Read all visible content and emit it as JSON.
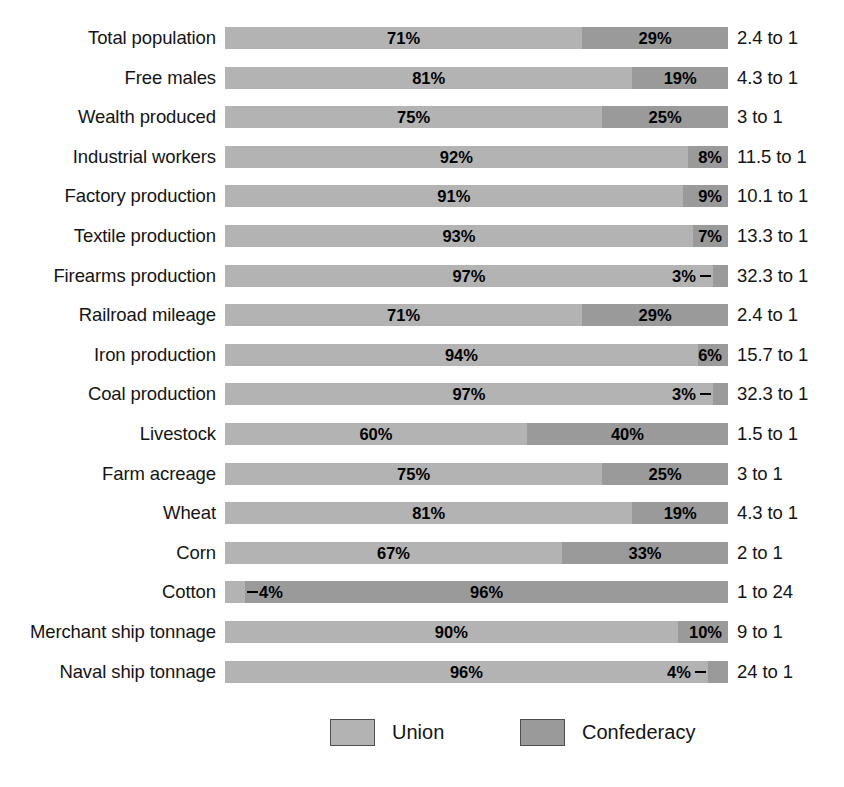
{
  "chart_data": {
    "type": "bar",
    "subtype": "stacked-horizontal-100-percent",
    "title": "",
    "xlabel": "",
    "ylabel": "",
    "xlim": [
      0,
      100
    ],
    "grid": false,
    "legend_position": "bottom",
    "categories": [
      "Total population",
      "Free males",
      "Wealth produced",
      "Industrial workers",
      "Factory production",
      "Textile production",
      "Firearms production",
      "Railroad mileage",
      "Iron production",
      "Coal production",
      "Livestock",
      "Farm acreage",
      "Wheat",
      "Corn",
      "Cotton",
      "Merchant ship tonnage",
      "Naval ship tonnage"
    ],
    "series": [
      {
        "name": "Union",
        "color": "#b3b3b3",
        "values": [
          71,
          81,
          75,
          92,
          91,
          93,
          97,
          71,
          94,
          97,
          60,
          75,
          81,
          67,
          4,
          90,
          96
        ]
      },
      {
        "name": "Confederacy",
        "color": "#9a9a9a",
        "values": [
          29,
          19,
          25,
          8,
          9,
          7,
          3,
          29,
          6,
          3,
          40,
          25,
          19,
          33,
          96,
          10,
          4
        ]
      }
    ],
    "ratios": [
      "2.4 to 1",
      "4.3 to 1",
      "3 to 1",
      "11.5 to 1",
      "10.1 to 1",
      "13.3 to 1",
      "32.3 to 1",
      "2.4 to 1",
      "15.7 to 1",
      "32.3 to 1",
      "1.5 to 1",
      "3 to 1",
      "4.3 to 1",
      "2 to 1",
      "1 to 24",
      "9 to 1",
      "24 to 1"
    ]
  },
  "rows": [
    {
      "label": "Total population",
      "union_pct": 71,
      "conf_pct": 29,
      "union_text": "71%",
      "conf_text": "29%",
      "ratio": "2.4 to 1",
      "leader": "none"
    },
    {
      "label": "Free males",
      "union_pct": 81,
      "conf_pct": 19,
      "union_text": "81%",
      "conf_text": "19%",
      "ratio": "4.3 to 1",
      "leader": "none"
    },
    {
      "label": "Wealth produced",
      "union_pct": 75,
      "conf_pct": 25,
      "union_text": "75%",
      "conf_text": "25%",
      "ratio": "3 to 1",
      "leader": "none"
    },
    {
      "label": "Industrial workers",
      "union_pct": 92,
      "conf_pct": 8,
      "union_text": "92%",
      "conf_text": "8%",
      "ratio": "11.5 to 1",
      "leader": "none"
    },
    {
      "label": "Factory production",
      "union_pct": 91,
      "conf_pct": 9,
      "union_text": "91%",
      "conf_text": "9%",
      "ratio": "10.1 to 1",
      "leader": "none"
    },
    {
      "label": "Textile production",
      "union_pct": 93,
      "conf_pct": 7,
      "union_text": "93%",
      "conf_text": "7%",
      "ratio": "13.3 to 1",
      "leader": "none"
    },
    {
      "label": "Firearms production",
      "union_pct": 97,
      "conf_pct": 3,
      "union_text": "97%",
      "conf_text": "3%",
      "ratio": "32.3 to 1",
      "leader": "right"
    },
    {
      "label": "Railroad mileage",
      "union_pct": 71,
      "conf_pct": 29,
      "union_text": "71%",
      "conf_text": "29%",
      "ratio": "2.4 to 1",
      "leader": "none"
    },
    {
      "label": "Iron production",
      "union_pct": 94,
      "conf_pct": 6,
      "union_text": "94%",
      "conf_text": "6%",
      "ratio": "15.7 to 1",
      "leader": "none"
    },
    {
      "label": "Coal production",
      "union_pct": 97,
      "conf_pct": 3,
      "union_text": "97%",
      "conf_text": "3%",
      "ratio": "32.3 to 1",
      "leader": "right"
    },
    {
      "label": "Livestock",
      "union_pct": 60,
      "conf_pct": 40,
      "union_text": "60%",
      "conf_text": "40%",
      "ratio": "1.5 to 1",
      "leader": "none"
    },
    {
      "label": "Farm acreage",
      "union_pct": 75,
      "conf_pct": 25,
      "union_text": "75%",
      "conf_text": "25%",
      "ratio": "3 to 1",
      "leader": "none"
    },
    {
      "label": "Wheat",
      "union_pct": 81,
      "conf_pct": 19,
      "union_text": "81%",
      "conf_text": "19%",
      "ratio": "4.3 to 1",
      "leader": "none"
    },
    {
      "label": "Corn",
      "union_pct": 67,
      "conf_pct": 33,
      "union_text": "67%",
      "conf_text": "33%",
      "ratio": "2 to 1",
      "leader": "none"
    },
    {
      "label": "Cotton",
      "union_pct": 4,
      "conf_pct": 96,
      "union_text": "4%",
      "conf_text": "96%",
      "ratio": "1 to 24",
      "leader": "left"
    },
    {
      "label": "Merchant ship tonnage",
      "union_pct": 90,
      "conf_pct": 10,
      "union_text": "90%",
      "conf_text": "10%",
      "ratio": "9 to 1",
      "leader": "none"
    },
    {
      "label": "Naval ship tonnage",
      "union_pct": 96,
      "conf_pct": 4,
      "union_text": "96%",
      "conf_text": "4%",
      "ratio": "24 to 1",
      "leader": "right"
    }
  ],
  "legend": {
    "union_label": "Union",
    "confederacy_label": "Confederacy",
    "union_color": "#b3b3b3",
    "confederacy_color": "#9a9a9a"
  }
}
